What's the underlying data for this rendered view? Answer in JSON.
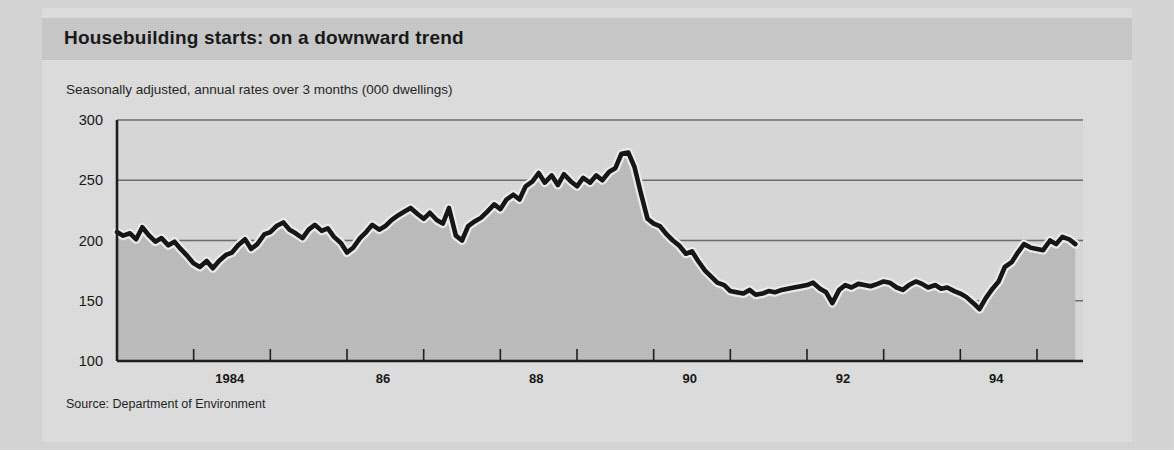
{
  "figure": {
    "title": "Housebuilding starts: on a downward trend",
    "subtitle": "Seasonally adjusted, annual rates over 3 months (000 dwellings)",
    "source": "Source: Department of Environment"
  },
  "colors": {
    "page_background": "#d6d6d6",
    "card_background": "#dedede",
    "header_band": "#c9c9c9",
    "plot_background": "#d9d9d9",
    "area_fill": "#bdbdbd",
    "line": "#121212",
    "line_halo": "#efefef",
    "gridline": "#6a6a6a",
    "axis": "#1b1b1b",
    "text": "#141414"
  },
  "chart_data": {
    "type": "area",
    "title": "Housebuilding starts: on a downward trend",
    "subtitle": "Seasonally adjusted, annual rates over 3 months (000 dwellings)",
    "xlabel": "",
    "ylabel": "000 dwellings",
    "ylim": [
      100,
      300
    ],
    "yticks": [
      100,
      150,
      200,
      250,
      300
    ],
    "ytick_labels": [
      "100",
      "150",
      "200",
      "250",
      "300"
    ],
    "xlim": [
      1983.0,
      1995.6
    ],
    "xticks": [
      1984,
      1985,
      1986,
      1987,
      1988,
      1989,
      1990,
      1991,
      1992,
      1993,
      1994,
      1995
    ],
    "xtick_labels": [
      "1984",
      "",
      "86",
      "",
      "88",
      "",
      "90",
      "",
      "92",
      "",
      "94",
      ""
    ],
    "grid": true,
    "legend": false,
    "series_name": "Housebuilding starts",
    "x": [
      1983.0,
      1983.08,
      1983.17,
      1983.25,
      1983.33,
      1983.42,
      1983.5,
      1983.58,
      1983.67,
      1983.75,
      1983.83,
      1983.92,
      1984.0,
      1984.08,
      1984.17,
      1984.25,
      1984.33,
      1984.42,
      1984.5,
      1984.58,
      1984.67,
      1984.75,
      1984.83,
      1984.92,
      1985.0,
      1985.08,
      1985.17,
      1985.25,
      1985.33,
      1985.42,
      1985.5,
      1985.58,
      1985.67,
      1985.75,
      1985.83,
      1985.92,
      1986.0,
      1986.08,
      1986.17,
      1986.25,
      1986.33,
      1986.42,
      1986.5,
      1986.58,
      1986.67,
      1986.75,
      1986.83,
      1986.92,
      1987.0,
      1987.08,
      1987.17,
      1987.25,
      1987.33,
      1987.42,
      1987.5,
      1987.58,
      1987.67,
      1987.75,
      1987.83,
      1987.92,
      1988.0,
      1988.08,
      1988.17,
      1988.25,
      1988.33,
      1988.42,
      1988.5,
      1988.58,
      1988.67,
      1988.75,
      1988.83,
      1988.92,
      1989.0,
      1989.08,
      1989.17,
      1989.25,
      1989.33,
      1989.42,
      1989.5,
      1989.58,
      1989.67,
      1989.75,
      1989.83,
      1989.92,
      1990.0,
      1990.08,
      1990.17,
      1990.25,
      1990.33,
      1990.42,
      1990.5,
      1990.58,
      1990.67,
      1990.75,
      1990.83,
      1990.92,
      1991.0,
      1991.08,
      1991.17,
      1991.25,
      1991.33,
      1991.42,
      1991.5,
      1991.58,
      1991.67,
      1991.75,
      1991.83,
      1991.92,
      1992.0,
      1992.08,
      1992.17,
      1992.25,
      1992.33,
      1992.42,
      1992.5,
      1992.58,
      1992.67,
      1992.75,
      1992.83,
      1992.92,
      1993.0,
      1993.08,
      1993.17,
      1993.25,
      1993.33,
      1993.42,
      1993.5,
      1993.58,
      1993.67,
      1993.75,
      1993.83,
      1993.92,
      1994.0,
      1994.08,
      1994.17,
      1994.25,
      1994.33,
      1994.42,
      1994.5,
      1994.58,
      1994.67,
      1994.75,
      1994.83,
      1994.92,
      1995.0,
      1995.08,
      1995.17,
      1995.25,
      1995.33,
      1995.42,
      1995.5
    ],
    "values": [
      207,
      204,
      206,
      201,
      211,
      204,
      199,
      202,
      196,
      199,
      193,
      187,
      181,
      178,
      183,
      177,
      183,
      188,
      190,
      196,
      201,
      193,
      197,
      205,
      207,
      212,
      215,
      209,
      206,
      202,
      209,
      213,
      208,
      210,
      203,
      198,
      190,
      194,
      202,
      207,
      213,
      209,
      212,
      217,
      221,
      224,
      227,
      222,
      218,
      223,
      217,
      214,
      227,
      204,
      200,
      212,
      216,
      219,
      224,
      230,
      226,
      234,
      238,
      234,
      245,
      249,
      256,
      248,
      254,
      246,
      255,
      249,
      245,
      252,
      248,
      254,
      250,
      257,
      260,
      272,
      273,
      261,
      240,
      218,
      214,
      212,
      205,
      200,
      196,
      189,
      191,
      183,
      175,
      170,
      165,
      163,
      158,
      157,
      156,
      159,
      155,
      156,
      158,
      157,
      159,
      160,
      161,
      162,
      163,
      165,
      160,
      157,
      148,
      159,
      163,
      161,
      164,
      163,
      162,
      164,
      166,
      165,
      161,
      159,
      163,
      166,
      164,
      161,
      163,
      160,
      161,
      158,
      156,
      153,
      148,
      143,
      152,
      160,
      166,
      178,
      182,
      190,
      197,
      194,
      193,
      192,
      200,
      197,
      203,
      201,
      197
    ],
    "annotations": [
      {
        "label": "peak",
        "x": 1989.67,
        "y": 273
      },
      {
        "label": "trough",
        "x": 1994.25,
        "y": 143
      },
      {
        "label": "final",
        "x": 1995.5,
        "y": 147
      }
    ]
  }
}
